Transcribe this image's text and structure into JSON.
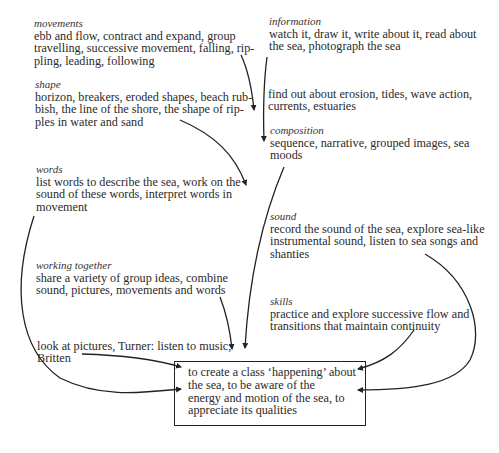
{
  "nodes": {
    "movements": {
      "label": "movements",
      "lines": [
        "ebb and flow, contract and expand, group",
        "travelling, successive movement, falling, rip-",
        "pling, leading, following"
      ]
    },
    "shape": {
      "label": "shape",
      "lines": [
        "horizon, breakers, eroded shapes, beach rub-",
        "bish, the line of the shore, the shape of rip-",
        "ples in water and sand"
      ]
    },
    "information": {
      "label": "information",
      "lines": [
        "watch it, draw it, write about it, read about",
        "the sea, photograph the sea"
      ]
    },
    "find_out": {
      "lines": [
        "find out about erosion, tides, wave action,",
        "currents, estuaries"
      ]
    },
    "composition": {
      "label": "composition",
      "lines": [
        "sequence, narrative, grouped images, sea",
        "moods"
      ]
    },
    "words": {
      "label": "words",
      "lines": [
        "list words to describe the sea, work on the",
        "sound of these words, interpret words in",
        "movement"
      ]
    },
    "sound": {
      "label": "sound",
      "lines": [
        "record the sound of the sea, explore sea-like",
        "instrumental sound, listen to sea songs and",
        "shanties"
      ]
    },
    "working_together": {
      "label": "working together",
      "lines": [
        "share a variety of group ideas, combine",
        "sound, pictures, movements and words"
      ]
    },
    "skills": {
      "label": "skills",
      "lines": [
        "practice and explore successive flow and",
        "transitions that maintain continuity"
      ]
    },
    "look_listen": {
      "lines": [
        "look at pictures, Turner: listen to music,",
        "Britten"
      ]
    },
    "goal": {
      "lines": [
        "to create a class ‘happening’ about",
        "the sea, to be aware of the",
        "energy and motion of the sea, to",
        "appreciate its qualities"
      ]
    }
  },
  "colors": {
    "ink": "#2a2a2a",
    "background": "#ffffff"
  }
}
